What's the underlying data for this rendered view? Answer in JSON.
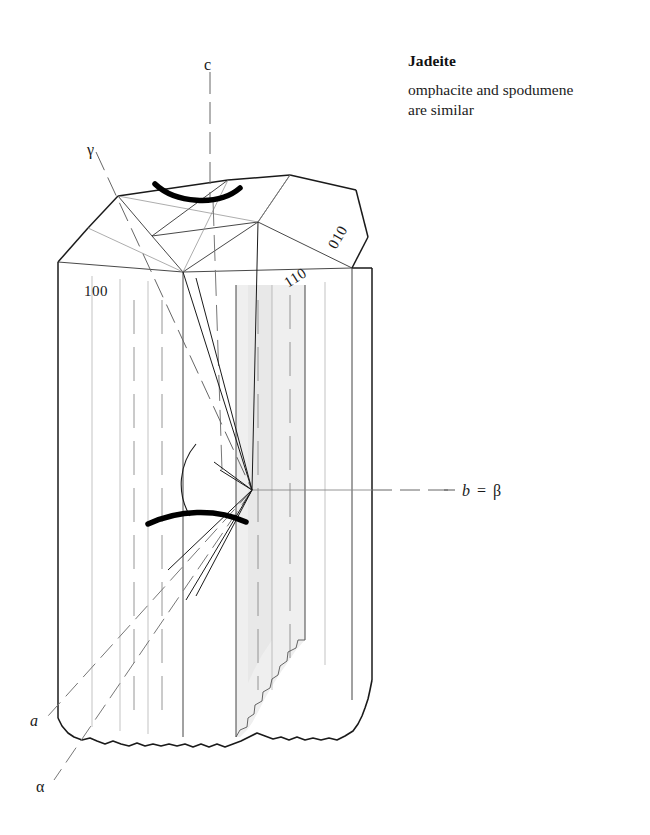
{
  "figure": {
    "title": "Jadeite",
    "subtitle_line1": "omphacite and spodumene",
    "subtitle_line2": "are similar",
    "mineral": "Jadeite",
    "crystal_system": "monoclinic",
    "habit": "prismatic crystal with broken base"
  },
  "face_labels": {
    "pinacoid_100": "100",
    "prism_110": "110",
    "pinacoid_010": "010"
  },
  "axis_labels": {
    "c_axis": "c",
    "a_axis": "a",
    "b_beta_axis": "b = β",
    "gamma": "γ",
    "alpha": "α",
    "b_italic": "b",
    "equals": "=",
    "beta": "β"
  },
  "colors": {
    "outline": "#1a1a1a",
    "thin_line": "#555555",
    "dashed_axis": "#666666",
    "shade_fill": "#efefef",
    "shade_fill_dark": "#e8e8e8",
    "bold_arc": "#000000",
    "background": "#ffffff",
    "text": "#1a1a1a"
  },
  "annotations": {
    "upper_arc": "extinction-angle arc on terminal face",
    "lower_arc": "extinction-angle arc on prism face",
    "angle_wedge": "optic axis angle wedge at b = β vertex",
    "shaded_band": "shaded cleavage trace band",
    "broken_base": "irregular broken base"
  }
}
